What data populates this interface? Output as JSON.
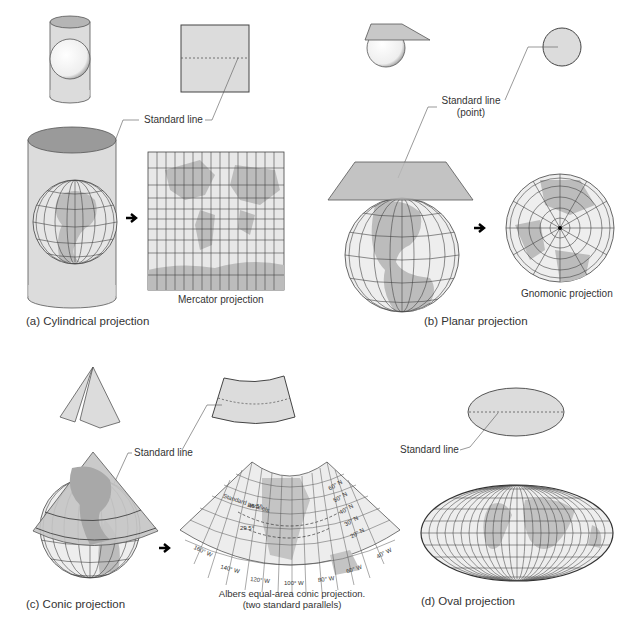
{
  "panels": {
    "cylindrical": {
      "caption": "(a) Cylindrical projection",
      "standard_line_label": "Standard line",
      "result_label": "Mercator projection"
    },
    "planar": {
      "caption": "(b) Planar projection",
      "standard_line_label_1": "Standard line",
      "standard_line_label_2": "(point)",
      "result_label": "Gnomonic projection"
    },
    "conic": {
      "caption": "(c) Conic projection",
      "standard_line_label": "Standard line",
      "result_label_1": "Albers equal-area conic projection.",
      "result_label_2": "(two standard parallels)",
      "standard_parallels_label": "Standard parallels",
      "parallel_values": [
        "45.5°",
        "29.5°"
      ],
      "latitude_labels": [
        "60° N",
        "50° N",
        "40° N",
        "30° N",
        "20° N"
      ],
      "longitude_labels": [
        "160° W",
        "140° W",
        "120° W",
        "100° W",
        "80° W",
        "60° W",
        "40° W"
      ]
    },
    "oval": {
      "caption": "(d) Oval projection",
      "standard_line_label": "Standard line"
    }
  },
  "colors": {
    "surface_fill": "#dcdcdc",
    "dark_fill": "#9a9a9a",
    "land": "#b9b9b9",
    "grid": "#444444",
    "background": "#ffffff"
  }
}
